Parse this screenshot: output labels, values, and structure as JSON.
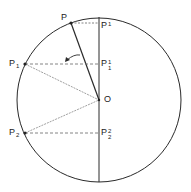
{
  "diagram": {
    "type": "geometry",
    "colors": {
      "stroke": "#2a2a2a",
      "dashed": "#555555",
      "background": "#ffffff"
    },
    "labels": {
      "P": {
        "base": "P",
        "sub": "",
        "sup": ""
      },
      "P_proj": {
        "base": "P",
        "sup": "1",
        "sub": ""
      },
      "P1": {
        "base": "P",
        "sub": "1",
        "sup": ""
      },
      "P1_proj": {
        "base": "P",
        "sup": "1",
        "sub": "1"
      },
      "O": {
        "base": "O",
        "sub": "",
        "sup": ""
      },
      "P2": {
        "base": "P",
        "sub": "2",
        "sup": ""
      },
      "P2_proj": {
        "base": "P",
        "sup": "2",
        "sub": "2"
      }
    },
    "points": {
      "center_O": [
        99,
        99
      ],
      "radius": 82,
      "P": [
        71,
        23
      ],
      "P_proj": [
        99,
        23
      ],
      "P1": [
        25,
        64
      ],
      "P1_proj": [
        99,
        64
      ],
      "P2": [
        25,
        133
      ],
      "P2_proj": [
        99,
        133
      ]
    },
    "arrow": {
      "direction": "counterclockwise",
      "meaning": "rotation of radius"
    }
  }
}
